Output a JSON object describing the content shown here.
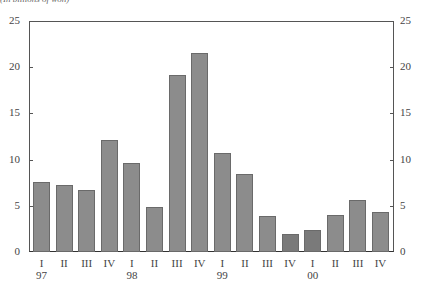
{
  "chart_data": {
    "type": "bar",
    "title": "",
    "subtitle": "(In billions of won)",
    "xlabel": "",
    "ylabel": "",
    "ylim": [
      0,
      25
    ],
    "yticks": [
      0,
      5,
      10,
      15,
      20,
      25
    ],
    "right_axis": true,
    "grid": false,
    "legend": null,
    "categories": [
      "I 97",
      "II 97",
      "III 97",
      "IV 97",
      "I 98",
      "II 98",
      "III 98",
      "IV 98",
      "I 99",
      "II 99",
      "III 99",
      "IV 99",
      "I 00",
      "II 00",
      "III 00",
      "IV 00"
    ],
    "quarter_labels": [
      "I",
      "II",
      "III",
      "IV",
      "I",
      "II",
      "III",
      "IV",
      "I",
      "II",
      "III",
      "IV",
      "I",
      "II",
      "III",
      "IV"
    ],
    "year_labels": [
      {
        "index": 0,
        "label": "97"
      },
      {
        "index": 4,
        "label": "98"
      },
      {
        "index": 8,
        "label": "99"
      },
      {
        "index": 12,
        "label": "00"
      }
    ],
    "values": [
      7.6,
      7.2,
      6.7,
      12.1,
      9.6,
      4.9,
      19.2,
      21.5,
      10.7,
      8.4,
      3.9,
      2.0,
      2.4,
      4.0,
      5.6,
      4.3
    ],
    "colors": {
      "bar": "#8c8c8c",
      "bar_dark": "#7a7a7a",
      "outline": "#6a6a6a"
    }
  }
}
